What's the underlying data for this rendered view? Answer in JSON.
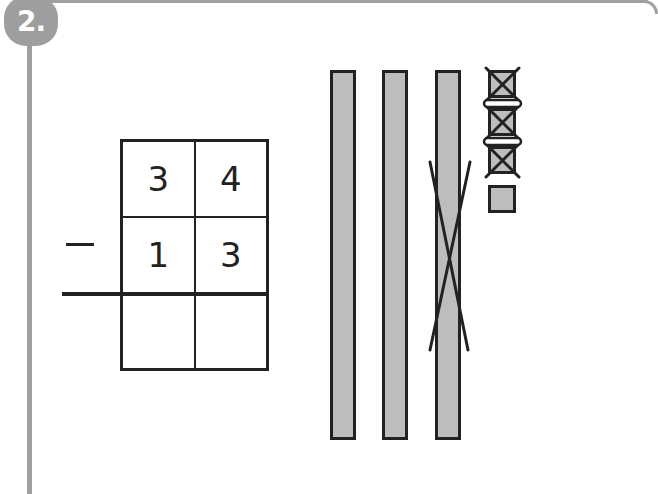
{
  "exercise": {
    "number_label": "2.",
    "operator": "−",
    "minuend": {
      "tens": "3",
      "ones": "4"
    },
    "subtrahend": {
      "tens": "1",
      "ones": "3"
    },
    "result": {
      "tens": "",
      "ones": ""
    }
  },
  "base_ten_blocks": {
    "tens_rods": [
      {
        "crossed_out": false
      },
      {
        "crossed_out": false
      },
      {
        "crossed_out": true
      }
    ],
    "unit_cubes": [
      {
        "crossed_out": true
      },
      {
        "crossed_out": true
      },
      {
        "crossed_out": true
      },
      {
        "crossed_out": false
      }
    ]
  },
  "colors": {
    "frame": "#a0a0a0",
    "block_fill": "#bdbdbd",
    "ink": "#222222"
  }
}
